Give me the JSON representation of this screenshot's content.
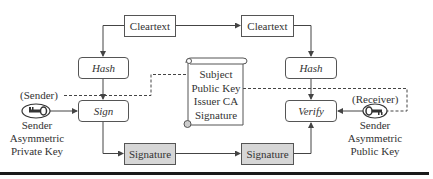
{
  "diagram": {
    "nodes": {
      "cleartext_sender": "Cleartext",
      "cleartext_receiver": "Cleartext",
      "hash_sender": "Hash",
      "hash_receiver": "Hash",
      "sign": "Sign",
      "verify": "Verify",
      "signature_sender": "Signature",
      "signature_receiver": "Signature"
    },
    "certificate": {
      "fields": [
        "Subject",
        "Public Key",
        "Issuer CA",
        "Signature"
      ]
    },
    "sender": {
      "role": "(Sender)",
      "key_label_lines": [
        "Sender",
        "Asymmetric",
        "Private Key"
      ]
    },
    "receiver": {
      "role": "(Receiver)",
      "key_label_lines": [
        "Sender",
        "Asymmetric",
        "Public Key"
      ]
    },
    "colors": {
      "line": "#444444",
      "box_border": "#555555",
      "shaded_fill": "#d6d6d6",
      "rule": "#1a1a1a"
    }
  }
}
